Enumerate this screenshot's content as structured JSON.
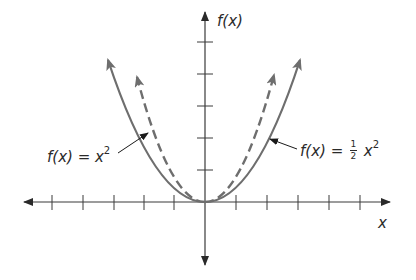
{
  "diagram": {
    "axes": {
      "x_label": "x",
      "y_label": "f(x)",
      "origin_px": [
        205,
        202
      ],
      "tick_spacing_px": 31,
      "x_ticks_left": 5,
      "x_ticks_right": 6,
      "y_ticks_up": 5
    },
    "curves": [
      {
        "name": "solid-parabola",
        "style": "solid",
        "color": "#6e6e6e",
        "left_tip_px": [
          105,
          55
        ],
        "right_tip_px": [
          303,
          55
        ]
      },
      {
        "name": "dashed-parabola",
        "style": "dashed",
        "color": "#6e6e6e",
        "left_tip_px": [
          135,
          72
        ],
        "right_tip_px": [
          276,
          70
        ]
      }
    ],
    "labels": {
      "left": {
        "prefix": "f(x) = x",
        "exponent": "2"
      },
      "right": {
        "prefix": "f(x) = ",
        "frac_num": "1",
        "frac_den": "2",
        "var": "x",
        "exponent": "2"
      }
    },
    "colors": {
      "axis": "#3a3a3a",
      "curve": "#6e6e6e",
      "text": "#2a2a2a",
      "background": "#ffffff"
    }
  }
}
